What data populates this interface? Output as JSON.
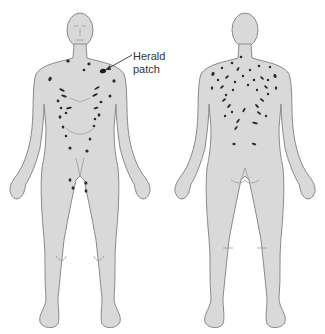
{
  "diagram": {
    "views": [
      {
        "name": "front",
        "label": "Anterior view"
      },
      {
        "name": "back",
        "label": "Posterior view"
      }
    ],
    "annotation": {
      "line1": "Herald",
      "line2": "patch",
      "target": "left upper chest near shoulder"
    },
    "colors": {
      "skin": "#d9d9d9",
      "outline": "#8a8a8a",
      "lesion": "#2b2b2b",
      "background": "#ffffff"
    }
  }
}
